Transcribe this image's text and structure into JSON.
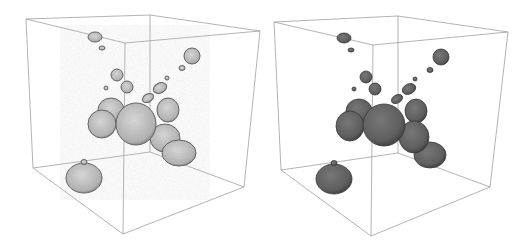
{
  "figure": {
    "panels": [
      {
        "id": "left",
        "style": "stippled-translucent",
        "fill": "#b8b8b8",
        "stroke": "#555555"
      },
      {
        "id": "right",
        "style": "solid-shaded",
        "fill": "#616161",
        "stroke": "#3a3a3a"
      }
    ],
    "box_color": "#9a9a9a"
  }
}
